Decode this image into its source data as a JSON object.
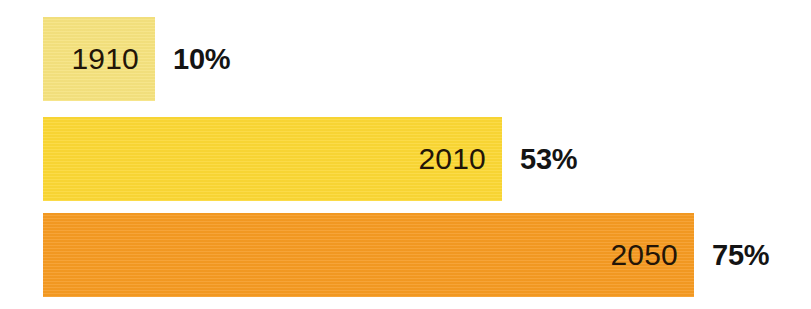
{
  "chart_data": {
    "type": "bar",
    "orientation": "horizontal",
    "title": "",
    "subtitle": "",
    "xlabel": "",
    "ylabel": "",
    "categories": [
      "1910",
      "2010",
      "2050"
    ],
    "values": [
      10,
      53,
      75
    ],
    "value_labels": [
      "10%",
      "53%",
      "75%"
    ],
    "unit": "%",
    "xlim": [
      0,
      100
    ],
    "grid": false,
    "legend": null,
    "background_color": "#FFFFFF",
    "bars": [
      {
        "category": "1910",
        "value": 10,
        "value_label": "10%",
        "color": "#F5E27E",
        "bar_px_width": 112,
        "label_inside": "1910",
        "label_outside": "10%"
      },
      {
        "category": "2010",
        "value": 53,
        "value_label": "53%",
        "color": "#FBD734",
        "bar_px_width": 459,
        "label_inside": "2010",
        "label_outside": "53%"
      },
      {
        "category": "2050",
        "value": 75,
        "value_label": "75%",
        "color": "#F59A22",
        "bar_px_width": 651,
        "label_inside": "2050",
        "label_outside": "75%"
      }
    ],
    "colors": {
      "bar_1910": "#F5E27E",
      "bar_2010": "#FBD734",
      "bar_2050": "#F59A22",
      "year_label_text": "#231508",
      "percent_label_text": "#141414"
    }
  }
}
